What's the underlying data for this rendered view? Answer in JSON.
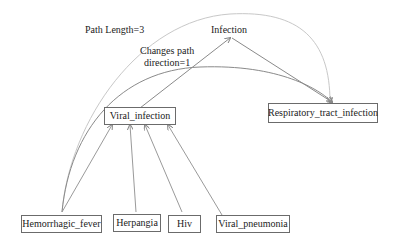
{
  "diagram": {
    "nodes": [
      {
        "id": "infection",
        "label": "Infection",
        "boxed": false
      },
      {
        "id": "viral_infection",
        "label": "Viral_infection",
        "boxed": true
      },
      {
        "id": "respiratory",
        "label": "Respiratory_tract_infection",
        "boxed": true
      },
      {
        "id": "hemorrhagic",
        "label": "Hemorrhagic_fever",
        "boxed": true
      },
      {
        "id": "herpangia",
        "label": "Herpangia",
        "boxed": true
      },
      {
        "id": "hiv",
        "label": "Hiv",
        "boxed": true
      },
      {
        "id": "viral_pneumonia",
        "label": "Viral_pneumonia",
        "boxed": true
      }
    ],
    "edges": [
      {
        "from": "hemorrhagic",
        "to": "viral_infection",
        "style": "straight"
      },
      {
        "from": "herpangia",
        "to": "viral_infection",
        "style": "straight"
      },
      {
        "from": "hiv",
        "to": "viral_infection",
        "style": "straight"
      },
      {
        "from": "viral_pneumonia",
        "to": "viral_infection",
        "style": "straight"
      },
      {
        "from": "viral_infection",
        "to": "infection",
        "style": "straight"
      },
      {
        "from": "infection",
        "to": "respiratory",
        "style": "straight"
      },
      {
        "from": "hemorrhagic",
        "to": "respiratory",
        "style": "curve"
      },
      {
        "from": "hemorrhagic",
        "to": "respiratory",
        "style": "outer-curve"
      }
    ],
    "annotations": {
      "path_length": "Path Length=3",
      "changes_line1": "Changes path",
      "changes_line2": "direction=1"
    }
  }
}
